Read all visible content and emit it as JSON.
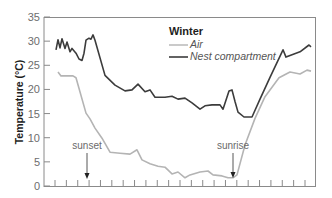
{
  "chart_data": {
    "type": "line",
    "title": "Winter",
    "xlabel": "",
    "ylabel": "Temperature (°C)",
    "ylim": [
      0,
      35
    ],
    "yticks": [
      0,
      5,
      10,
      15,
      20,
      25,
      30,
      35
    ],
    "xticks_count": 23,
    "x_tick_labels": [],
    "grid": false,
    "legend_position": "upper center",
    "colors": {
      "air": "#b4b4b4",
      "nest": "#3c3c3c",
      "axis": "#8a8a8a",
      "annotation": "#6a6a6a"
    },
    "series": [
      {
        "name": "Air",
        "key": "air",
        "x": [
          58,
          61,
          73,
          76,
          86,
          90,
          95,
          102,
          110,
          120,
          130,
          137,
          142,
          150,
          158,
          165,
          172,
          178,
          185,
          190,
          200,
          208,
          213,
          222,
          228,
          233,
          237,
          245,
          255,
          265,
          279,
          290,
          300,
          307,
          311
        ],
        "values": [
          23.6,
          22.8,
          22.8,
          22.4,
          15.1,
          13.9,
          12.0,
          9.9,
          7.0,
          6.8,
          6.6,
          7.5,
          5.4,
          4.6,
          4.1,
          3.9,
          2.5,
          2.9,
          1.7,
          2.3,
          2.9,
          3.1,
          2.3,
          2.1,
          1.7,
          1.7,
          2.3,
          8.5,
          14.0,
          18.5,
          22.4,
          23.6,
          23.2,
          24.0,
          23.8
        ]
      },
      {
        "name": "Nest compartment",
        "key": "nest",
        "x": [
          56,
          58,
          60,
          62,
          65,
          67,
          70,
          72,
          76,
          79,
          82,
          84,
          86,
          89,
          91,
          93,
          95,
          105,
          115,
          125,
          132,
          138,
          145,
          150,
          155,
          165,
          172,
          178,
          185,
          192,
          200,
          205,
          212,
          220,
          223,
          229,
          232,
          235,
          238,
          244,
          252,
          260,
          270,
          283,
          286,
          292,
          300,
          309,
          311
        ],
        "values": [
          28.2,
          30.3,
          28.6,
          30.5,
          28.5,
          29.8,
          27.8,
          28.5,
          27.5,
          26.3,
          26.0,
          27.5,
          30.2,
          30.6,
          30.4,
          31.3,
          30.2,
          22.9,
          20.9,
          19.7,
          19.9,
          21.1,
          19.5,
          19.9,
          18.4,
          18.4,
          18.6,
          18.0,
          18.2,
          17.2,
          15.9,
          16.6,
          16.8,
          16.8,
          15.9,
          19.7,
          19.9,
          17.5,
          15.3,
          14.3,
          14.3,
          18.0,
          22.5,
          28.2,
          26.7,
          27.2,
          27.8,
          29.2,
          28.8
        ]
      }
    ],
    "annotations": [
      {
        "text": "sunset",
        "x": 87,
        "arrow_from_y": 5.5,
        "arrow_to_y": 1.7
      },
      {
        "text": "sunrise",
        "x": 233,
        "arrow_from_y": 7.8,
        "arrow_to_y": 1.7
      }
    ]
  },
  "legend": {
    "title": "Winter",
    "items": [
      {
        "label": "Air",
        "key": "air"
      },
      {
        "label": "Nest compartment",
        "key": "nest"
      }
    ]
  },
  "axis": {
    "ylabel": "Temperature (°C)",
    "ytick_labels": [
      "0",
      "5",
      "10",
      "15",
      "20",
      "25",
      "30",
      "35"
    ]
  },
  "annotations": {
    "sunset": "sunset",
    "sunrise": "sunrise"
  }
}
